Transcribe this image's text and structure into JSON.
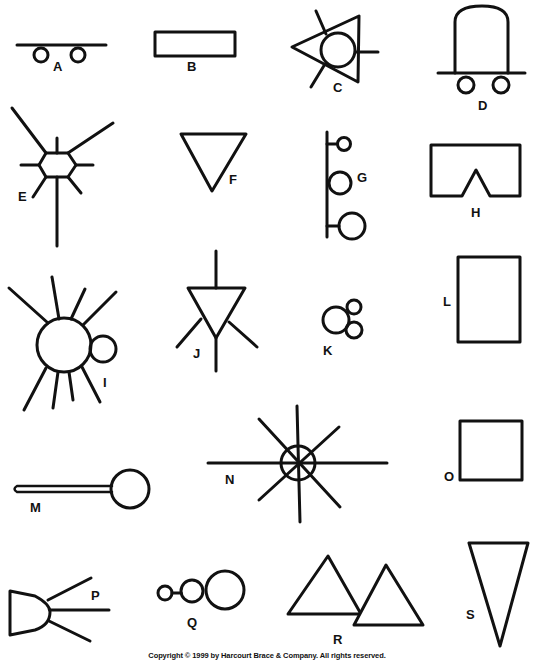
{
  "figure": {
    "title_partial": "",
    "stroke_color": "#111111",
    "background": "#ffffff",
    "shapes": [
      {
        "label": "A",
        "description": "horizontal line with two small circles below"
      },
      {
        "label": "B",
        "description": "long thin rectangle"
      },
      {
        "label": "C",
        "description": "triangle overlapping circle with three spokes"
      },
      {
        "label": "D",
        "description": "dome shape on a line with two circles below"
      },
      {
        "label": "E",
        "description": "hexagon with radiating lines"
      },
      {
        "label": "F",
        "description": "downward-pointing triangle"
      },
      {
        "label": "G",
        "description": "vertical line with three circles of increasing size"
      },
      {
        "label": "H",
        "description": "rectangle with triangular notch in bottom"
      },
      {
        "label": "I",
        "description": "large circle with rays and small attached circle"
      },
      {
        "label": "J",
        "description": "downward triangle with four lines"
      },
      {
        "label": "K",
        "description": "cluster of three circles"
      },
      {
        "label": "L",
        "description": "tall rectangle"
      },
      {
        "label": "M",
        "description": "thin stick with circle at end"
      },
      {
        "label": "N",
        "description": "circle with eight radiating lines through center"
      },
      {
        "label": "O",
        "description": "square"
      },
      {
        "label": "P",
        "description": "trapezoid with three lines extending right"
      },
      {
        "label": "Q",
        "description": "three circles in a row increasing in size"
      },
      {
        "label": "R",
        "description": "two overlapping upright triangles"
      },
      {
        "label": "S",
        "description": "tall narrow downward triangle"
      }
    ]
  },
  "labels": {
    "A": "A",
    "B": "B",
    "C": "C",
    "D": "D",
    "E": "E",
    "F": "F",
    "G": "G",
    "H": "H",
    "I": "I",
    "J": "J",
    "K": "K",
    "L": "L",
    "M": "M",
    "N": "N",
    "O": "O",
    "P": "P",
    "Q": "Q",
    "R": "R",
    "S": "S"
  },
  "footer": {
    "copyright": "Copyright © 1999 by Harcourt Brace & Company.  All rights reserved."
  }
}
